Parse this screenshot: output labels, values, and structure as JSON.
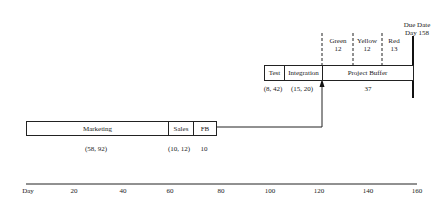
{
  "diagram": {
    "due_date": {
      "line1": "Due Date",
      "line2": "Day 158"
    },
    "critical_chain": [
      {
        "name": "Test",
        "estimate": "(8, 42)"
      },
      {
        "name": "Integration",
        "estimate": "(15, 20)"
      },
      {
        "name": "Project Buffer",
        "estimate": "37"
      }
    ],
    "feeding_chain": [
      {
        "name": "Marketing",
        "estimate": "(58, 92)"
      },
      {
        "name": "Sales",
        "estimate": "(10, 12)"
      },
      {
        "name": "FB",
        "estimate": "10"
      }
    ],
    "buffer_zones": [
      {
        "name": "Green",
        "value": "12"
      },
      {
        "name": "Yellow",
        "value": "12"
      },
      {
        "name": "Red",
        "value": "13"
      }
    ],
    "axis": {
      "label": "Day",
      "ticks": [
        "20",
        "40",
        "60",
        "80",
        "100",
        "120",
        "140",
        "160"
      ]
    }
  },
  "colors": {
    "line": "#222222",
    "background": "#ffffff"
  }
}
